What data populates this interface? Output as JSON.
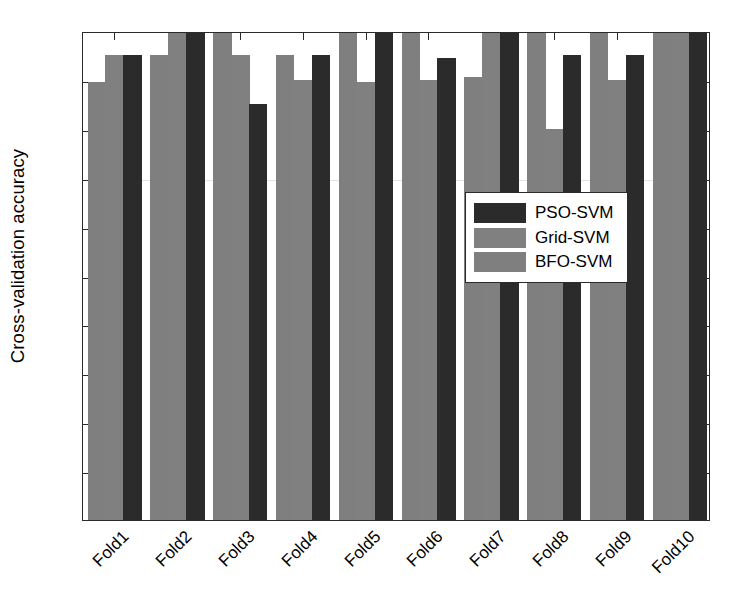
{
  "chart_data": {
    "type": "bar",
    "title": "",
    "xlabel": "",
    "ylabel": "Cross-validation accuracy",
    "categories": [
      "Fold1",
      "Fold2",
      "Fold3",
      "Fold4",
      "Fold5",
      "Fold6",
      "Fold7",
      "Fold8",
      "Fold9",
      "Fold10"
    ],
    "series": [
      {
        "name": "BFO-SVM",
        "color": "#7f7f7f",
        "values": [
          0.895,
          0.95,
          1.0,
          0.95,
          1.0,
          1.0,
          0.905,
          1.0,
          1.0,
          1.0
        ]
      },
      {
        "name": "Grid-SVM",
        "color": "#808080",
        "values": [
          0.95,
          1.0,
          0.95,
          0.9,
          0.895,
          0.9,
          1.0,
          0.8,
          0.9,
          1.0
        ]
      },
      {
        "name": "PSO-SVM",
        "color": "#2b2b2b",
        "values": [
          0.95,
          1.0,
          0.85,
          0.95,
          1.0,
          0.945,
          1.0,
          0.95,
          0.95,
          1.0
        ]
      }
    ],
    "ylim": [
      0,
      1
    ],
    "yticks": [
      0,
      0.1,
      0.2,
      0.3,
      0.4,
      0.5,
      0.6,
      0.7,
      0.8,
      0.9,
      1
    ],
    "ytick_labels": [
      "0",
      "0.1",
      "0.2",
      "0.3",
      "0.4",
      "0.5",
      "0.6",
      "0.7",
      "0.8",
      "0.9",
      "1"
    ],
    "grid": false,
    "legend_position": "center-right",
    "legend_order": [
      "PSO-SVM",
      "Grid-SVM",
      "BFO-SVM"
    ]
  },
  "legend": {
    "items": [
      {
        "label": "PSO-SVM",
        "color": "#2b2b2b"
      },
      {
        "label": "Grid-SVM",
        "color": "#808080"
      },
      {
        "label": "BFO-SVM",
        "color": "#7f7f7f"
      }
    ]
  },
  "axes": {
    "y_label": "Cross-validation accuracy"
  }
}
